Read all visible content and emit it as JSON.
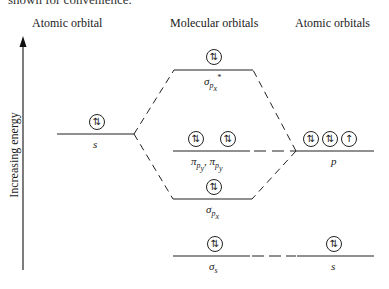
{
  "caption_cut": "shown for convenience.",
  "headers": {
    "left": "Atomic orbital",
    "middle": "Molecular orbitals",
    "right": "Atomic orbitals"
  },
  "axis": {
    "label": "Increasing energy",
    "direction": "up"
  },
  "left_atom": {
    "orbital": "s",
    "electrons": "⇅"
  },
  "molecular_orbitals": [
    {
      "name": "sigma_px_star",
      "label": "σ",
      "sub": "p",
      "subsub": "x",
      "sup": "*",
      "electrons": [
        "⇅"
      ]
    },
    {
      "name": "pi_py",
      "label": "π",
      "sub": "p",
      "subsub": "y",
      "label2": ", π",
      "sub2": "p",
      "subsub2": "y",
      "electrons": [
        "⇅",
        "⇅"
      ]
    },
    {
      "name": "sigma_px",
      "label": "σ",
      "sub": "p",
      "subsub": "x",
      "electrons": [
        "⇅"
      ]
    },
    {
      "name": "sigma_s",
      "label": "σ",
      "sub": "s",
      "electrons": [
        "⇅"
      ]
    }
  ],
  "right_atom": {
    "p": {
      "orbital": "p",
      "electrons": [
        "⇅",
        "⇅",
        "↑"
      ]
    },
    "s": {
      "orbital": "s",
      "electrons": [
        "⇅"
      ]
    }
  }
}
